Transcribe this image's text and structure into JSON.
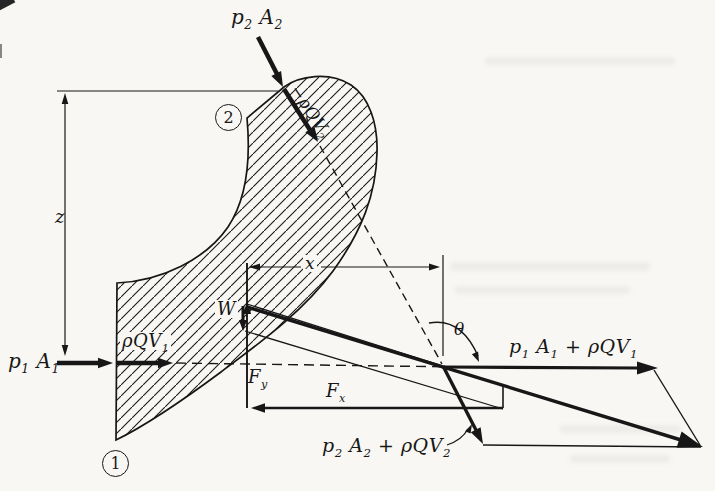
{
  "figure": {
    "colors": {
      "paper": "#f8f7f4",
      "ink": "#171717"
    },
    "stations": {
      "inlet": "1",
      "outlet": "2"
    },
    "labels": {
      "p2A2": "p_2 A_2",
      "rhoQV2": "−ρQV_2",
      "z": "z",
      "x": "x",
      "p1A1": "p_1 A_1",
      "rhoQV1": "ρQV_1",
      "weight": "W",
      "Fy": "F_y",
      "Fx": "F_x",
      "theta": "θ",
      "sum1": "p_1 A_1 + ρQV_1",
      "sum2": "p_2 A_2 + ρQV_2"
    }
  }
}
